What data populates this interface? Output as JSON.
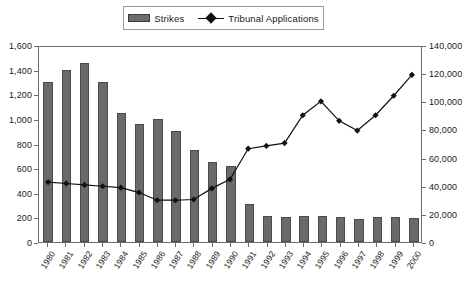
{
  "legend": {
    "position": "top-center",
    "entries": [
      {
        "label": "Strikes",
        "marker": "bar-swatch-icon",
        "color": "#6a6a6a"
      },
      {
        "label": "Tribunal Applications",
        "marker": "line-diamond-icon",
        "color": "#111111"
      }
    ]
  },
  "axes": {
    "left": {
      "ticks": [
        "0",
        "200",
        "400",
        "600",
        "800",
        "1,000",
        "1,200",
        "1,400",
        "1,600"
      ],
      "min": 0,
      "max": 1600
    },
    "right": {
      "ticks": [
        "0",
        "20,000",
        "40,000",
        "60,000",
        "80,000",
        "100,000",
        "120,000",
        "140,000"
      ],
      "min": 0,
      "max": 140000
    }
  },
  "chart_data": {
    "type": "bar",
    "title": "",
    "subtitle": "",
    "xlabel": "",
    "ylabel": "",
    "y2label": "",
    "grid": false,
    "legend_position": "top-center",
    "categories": [
      "1980",
      "1981",
      "1982",
      "1983",
      "1984",
      "1985",
      "1986",
      "1987",
      "1988",
      "1989",
      "1990",
      "1991",
      "1992",
      "1993",
      "1994",
      "1995",
      "1996",
      "1997",
      "1998",
      "1999",
      "2000"
    ],
    "ylim": [
      0,
      1600
    ],
    "y2lim": [
      0,
      140000
    ],
    "series": [
      {
        "name": "Strikes",
        "type": "bar",
        "axis": "left",
        "color": "#6a6a6a",
        "values": [
          1300,
          1400,
          1450,
          1300,
          1050,
          960,
          1000,
          900,
          750,
          650,
          620,
          310,
          210,
          200,
          210,
          210,
          200,
          190,
          200,
          200,
          195
        ]
      },
      {
        "name": "Tribunal Applications",
        "type": "line",
        "axis": "right",
        "color": "#111111",
        "marker": "diamond",
        "values": [
          43000,
          42000,
          41000,
          40000,
          39000,
          35500,
          30000,
          30000,
          30500,
          38500,
          45000,
          67000,
          69000,
          71000,
          91000,
          101000,
          87000,
          80000,
          91000,
          105000,
          120000
        ]
      }
    ]
  }
}
